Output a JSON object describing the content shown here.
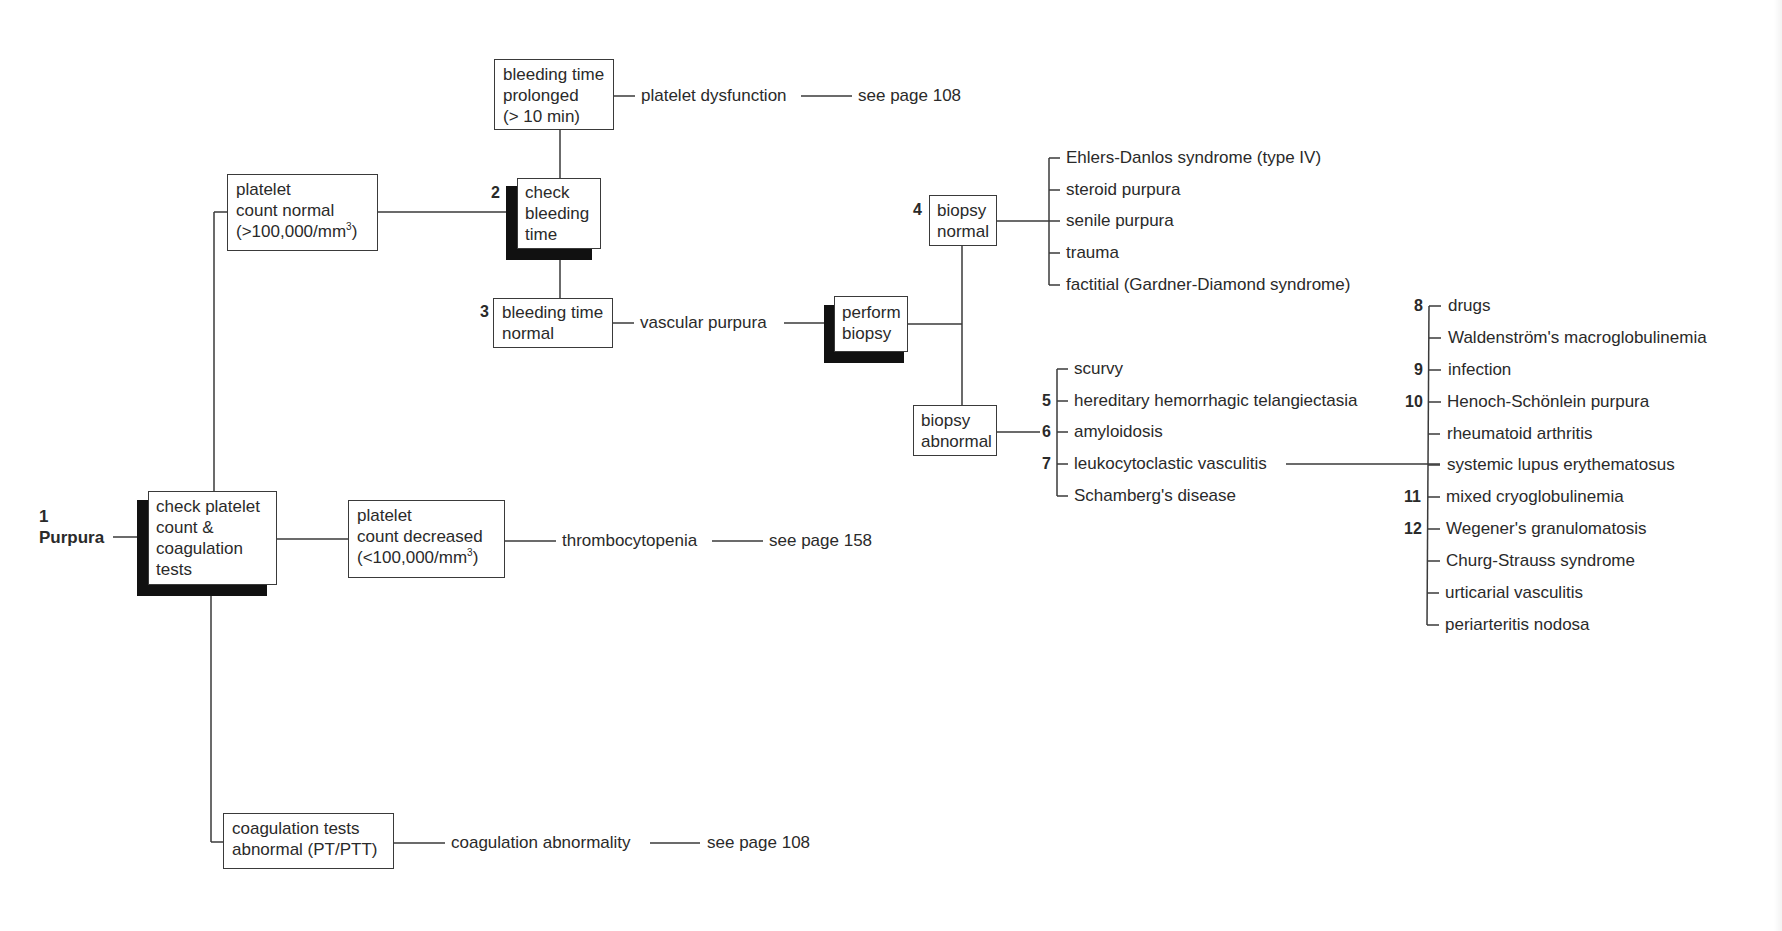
{
  "diagram": {
    "root": {
      "number": "1",
      "label": "Purpura"
    },
    "boxes": {
      "check_platelet": {
        "lines": [
          "check platelet",
          "count &",
          "coagulation",
          "tests"
        ]
      },
      "platelet_normal": {
        "lines": [
          "platelet",
          "count normal",
          "(>100,000/mm",
          "3",
          ")"
        ]
      },
      "platelet_decreased": {
        "lines": [
          "platelet",
          "count decreased",
          "(<100,000/mm",
          "3",
          ")"
        ]
      },
      "coag_abnormal": {
        "lines": [
          "coagulation tests",
          "abnormal (PT/PTT)"
        ]
      },
      "check_bleeding": {
        "number": "2",
        "lines": [
          "check",
          "bleeding",
          "time"
        ]
      },
      "bleeding_prolonged": {
        "lines": [
          "bleeding time",
          "prolonged",
          "(> 10 min)"
        ]
      },
      "bleeding_normal": {
        "number": "3",
        "lines": [
          "bleeding time",
          "normal"
        ]
      },
      "perform_biopsy": {
        "lines": [
          "perform",
          "biopsy"
        ]
      },
      "biopsy_normal": {
        "number": "4",
        "lines": [
          "biopsy",
          "normal"
        ]
      },
      "biopsy_abnormal": {
        "lines": [
          "biopsy",
          "abnormal"
        ]
      }
    },
    "outcomes": {
      "platelet_dysfunction": {
        "label": "platelet dysfunction",
        "ref": "see page 108"
      },
      "thrombocytopenia": {
        "label": "thrombocytopenia",
        "ref": "see page 158"
      },
      "coagulation_abnormality": {
        "label": "coagulation abnormality",
        "ref": "see page 108"
      },
      "vascular_purpura": {
        "label": "vascular purpura"
      }
    },
    "biopsy_normal_causes": [
      {
        "label": "Ehlers-Danlos syndrome (type IV)"
      },
      {
        "label": "steroid purpura"
      },
      {
        "label": "senile purpura"
      },
      {
        "label": "trauma"
      },
      {
        "label": "factitial (Gardner-Diamond syndrome)"
      }
    ],
    "biopsy_abnormal_causes": [
      {
        "number": "",
        "label": "scurvy"
      },
      {
        "number": "5",
        "label": "hereditary hemorrhagic telangiectasia"
      },
      {
        "number": "6",
        "label": "amyloidosis"
      },
      {
        "number": "7",
        "label": "leukocytoclastic vasculitis"
      },
      {
        "number": "",
        "label": "Schamberg's disease"
      }
    ],
    "vasculitis_causes": [
      {
        "number": "8",
        "label": "drugs"
      },
      {
        "number": "",
        "label": "Waldenström's macroglobulinemia"
      },
      {
        "number": "9",
        "label": "infection"
      },
      {
        "number": "10",
        "label": "Henoch-Schönlein purpura"
      },
      {
        "number": "",
        "label": "rheumatoid arthritis"
      },
      {
        "number": "",
        "label": "systemic lupus erythematosus"
      },
      {
        "number": "11",
        "label": "mixed cryoglobulinemia"
      },
      {
        "number": "12",
        "label": "Wegener's granulomatosis"
      },
      {
        "number": "",
        "label": "Churg-Strauss syndrome"
      },
      {
        "number": "",
        "label": "urticarial vasculitis"
      },
      {
        "number": "",
        "label": "periarteritis nodosa"
      }
    ],
    "colors": {
      "ink": "#2a2a2a",
      "line": "#3a3a3a",
      "shadow": "#111111",
      "background": "#ffffff"
    }
  }
}
